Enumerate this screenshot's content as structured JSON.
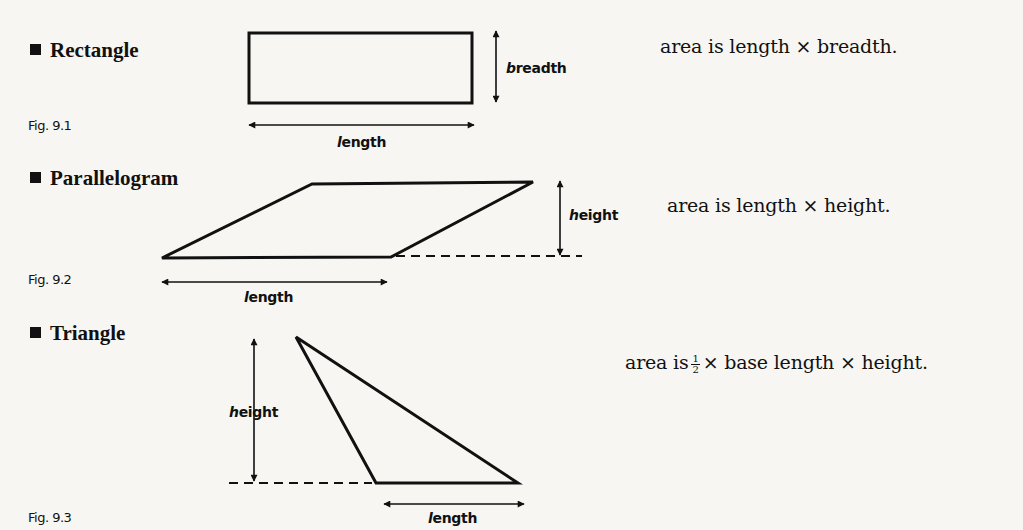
{
  "shapes": [
    {
      "name": "Rectangle",
      "figure": "Fig. 9.1",
      "labels": {
        "breadth_first": "b",
        "breadth_rest": "readth",
        "length_first": "l",
        "length_rest": "ength"
      },
      "formula": "area is length  × breadth."
    },
    {
      "name": "Parallelogram",
      "figure": "Fig. 9.2",
      "labels": {
        "height_first": "h",
        "height_rest": "eight",
        "length_first": "l",
        "length_rest": "ength"
      },
      "formula": "area is length  × height."
    },
    {
      "name": "Triangle",
      "figure": "Fig. 9.3",
      "labels": {
        "height_first": "h",
        "height_rest": "eight",
        "length_first": "l",
        "length_rest": "ength"
      },
      "formula_prefix": "area is",
      "fraction": {
        "numerator": "1",
        "denominator": "2"
      },
      "formula_suffix": "× base length × height."
    }
  ]
}
